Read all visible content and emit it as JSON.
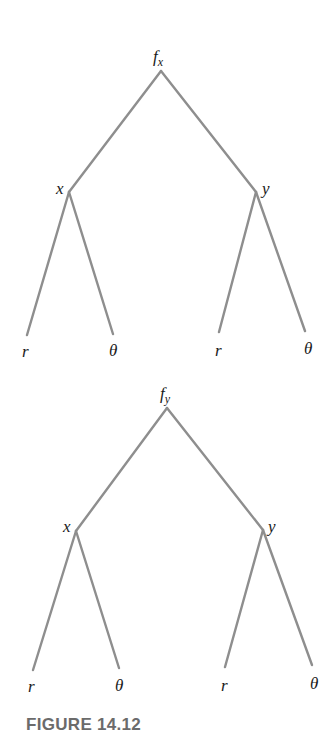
{
  "trees": [
    {
      "root": {
        "label": "f",
        "subscript": "x"
      },
      "children": [
        {
          "label": "x",
          "leaves": [
            "r",
            "θ"
          ]
        },
        {
          "label": "y",
          "leaves": [
            "r",
            "θ"
          ]
        }
      ]
    },
    {
      "root": {
        "label": "f",
        "subscript": "y"
      },
      "children": [
        {
          "label": "x",
          "leaves": [
            "r",
            "θ"
          ]
        },
        {
          "label": "y",
          "leaves": [
            "r",
            "θ"
          ]
        }
      ]
    }
  ],
  "caption": "FIGURE 14.12",
  "colors": {
    "edge": "#8e8e8e",
    "caption": "#6b6b6b",
    "text": "#1a1a1a"
  }
}
